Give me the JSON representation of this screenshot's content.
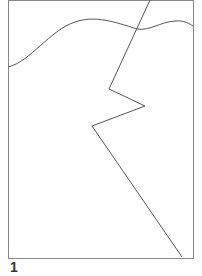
{
  "figure": {
    "label": "1",
    "frame": {
      "x": 8,
      "y": 0,
      "width": 185,
      "height": 258,
      "stroke": "#888888"
    },
    "curve": {
      "description": "wavy horizontal line across upper portion",
      "stroke": "#555555",
      "path": "M8,67 C30,62 50,30 75,22 C95,15 115,22 137,29 C150,31 160,22 175,21 C184,20 190,24 193,26"
    },
    "zigzag": {
      "description": "jagged line from top edge to bottom-right corner",
      "stroke": "#555555",
      "points": "150,0 109,89 145,106 92,126 182,257"
    }
  }
}
